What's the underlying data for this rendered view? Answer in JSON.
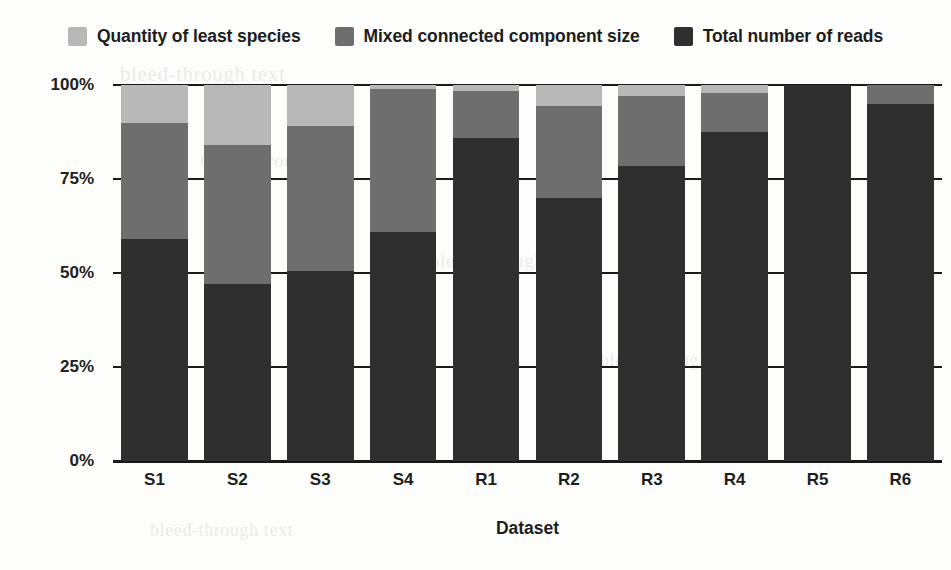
{
  "chart_data": {
    "type": "bar",
    "stacked": true,
    "normalized_percent": true,
    "title": "",
    "xlabel": "Dataset",
    "ylabel": "",
    "ylim": [
      0,
      100
    ],
    "yticks": [
      0,
      25,
      50,
      75,
      100
    ],
    "ytick_labels": [
      "0%",
      "25%",
      "50%",
      "75%",
      "100%"
    ],
    "grid": true,
    "legend_position": "top",
    "categories": [
      "S1",
      "S2",
      "S3",
      "S4",
      "R1",
      "R2",
      "R3",
      "R4",
      "R5",
      "R6"
    ],
    "series": [
      {
        "name": "Total number of reads",
        "color": "#2f2f2f",
        "values": [
          59,
          47,
          50.5,
          61,
          86,
          70,
          78.5,
          87.5,
          100,
          95
        ]
      },
      {
        "name": "Mixed connected component size",
        "color": "#6e6e6e",
        "values": [
          31,
          37,
          38.5,
          38,
          12.5,
          24.5,
          18.5,
          10.5,
          0,
          5
        ]
      },
      {
        "name": "Quantity of least species",
        "color": "#b8b8b8",
        "values": [
          10,
          16,
          11,
          1,
          1.5,
          5.5,
          3,
          2,
          0,
          0
        ]
      }
    ]
  },
  "legend": {
    "items": [
      {
        "label": "Quantity of least species",
        "color": "#b8b8b8",
        "swatch_name": "legend-swatch-quantity-of-least-species"
      },
      {
        "label": "Mixed connected component size",
        "color": "#6e6e6e",
        "swatch_name": "legend-swatch-mixed-connected-component-size"
      },
      {
        "label": "Total number of reads",
        "color": "#2f2f2f",
        "swatch_name": "legend-swatch-total-number-of-reads"
      }
    ]
  },
  "axes": {
    "x_title": "Dataset",
    "y_tick_labels": [
      "100%",
      "75%",
      "50%",
      "25%",
      "0%"
    ],
    "x_tick_labels": [
      "S1",
      "S2",
      "S3",
      "S4",
      "R1",
      "R2",
      "R3",
      "R4",
      "R5",
      "R6"
    ]
  },
  "background_artifacts": {
    "line_1": "bleed-through text",
    "line_2": "bleed-through text",
    "line_3": "bleed-through text",
    "line_4": "bleed-through text",
    "line_5": "bleed-through text"
  }
}
